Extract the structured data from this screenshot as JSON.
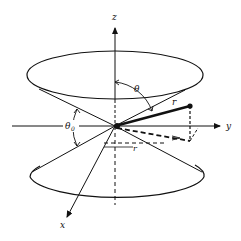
{
  "figure": {
    "axes": {
      "x": "x",
      "y": "y",
      "z": "z"
    },
    "labels": {
      "theta": "θ",
      "theta0": "θ",
      "theta0_sub": "0",
      "r": "r",
      "rho": "r"
    },
    "colors": {
      "ink": "#111111",
      "background": "#ffffff"
    }
  }
}
